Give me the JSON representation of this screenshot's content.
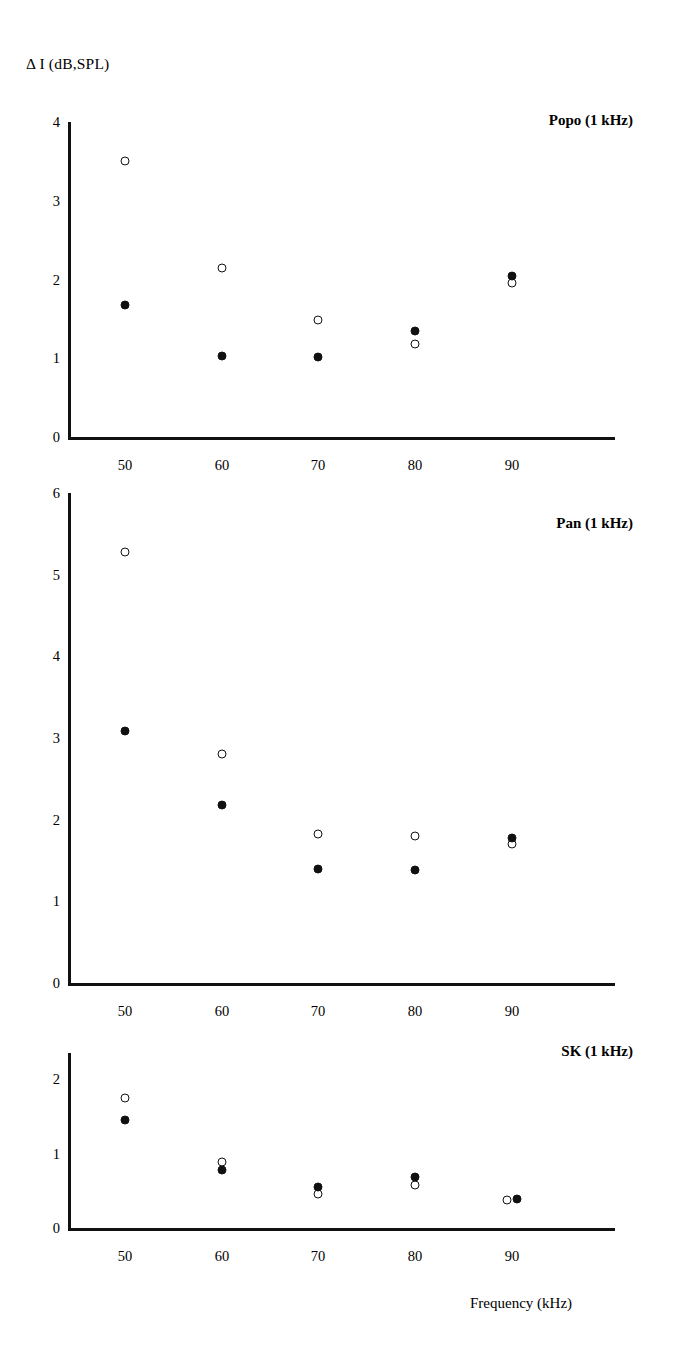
{
  "figure": {
    "ylabel": "Δ I (dB,SPL)",
    "xlabel": "Frequency (kHz)"
  },
  "chart_data": [
    {
      "type": "scatter",
      "title": "Popo (1 kHz)",
      "xlabel": "",
      "ylabel": "Δ I (dB,SPL)",
      "x": [
        50,
        60,
        70,
        80,
        90
      ],
      "xticklabels": [
        "50",
        "60",
        "70",
        "80",
        "90"
      ],
      "yticklabels": [
        "0",
        "1",
        "2",
        "3",
        "4"
      ],
      "xlim": [
        44,
        96
      ],
      "ylim": [
        0,
        4
      ],
      "grid": false,
      "legend": null,
      "series": [
        {
          "name": "open-circle",
          "marker": "open",
          "values": [
            3.5,
            2.15,
            1.48,
            1.18,
            1.95
          ]
        },
        {
          "name": "filled-circle",
          "marker": "filled",
          "values": [
            1.67,
            1.03,
            1.02,
            1.35,
            2.05
          ]
        }
      ]
    },
    {
      "type": "scatter",
      "title": "Pan (1 kHz)",
      "xlabel": "",
      "ylabel": "Δ I (dB,SPL)",
      "x": [
        50,
        60,
        70,
        80,
        90
      ],
      "xticklabels": [
        "50",
        "60",
        "70",
        "80",
        "90"
      ],
      "yticklabels": [
        "0",
        "1",
        "2",
        "3",
        "4",
        "5",
        "6"
      ],
      "xlim": [
        44,
        96
      ],
      "ylim": [
        0,
        6
      ],
      "grid": false,
      "legend": null,
      "series": [
        {
          "name": "open-circle",
          "marker": "open",
          "values": [
            5.28,
            2.8,
            1.82,
            1.8,
            1.7
          ]
        },
        {
          "name": "filled-circle",
          "marker": "filled",
          "values": [
            3.08,
            2.18,
            1.4,
            1.38,
            1.78
          ]
        }
      ]
    },
    {
      "type": "scatter",
      "title": "SK (1 kHz)",
      "xlabel": "Frequency (kHz)",
      "ylabel": "Δ I (dB,SPL)",
      "x": [
        50,
        60,
        70,
        80,
        90
      ],
      "xticklabels": [
        "50",
        "60",
        "70",
        "80",
        "90"
      ],
      "yticklabels": [
        "0",
        "1",
        "2"
      ],
      "xlim": [
        44,
        96
      ],
      "ylim": [
        0,
        2.35
      ],
      "grid": false,
      "legend": null,
      "series": [
        {
          "name": "open-circle",
          "marker": "open",
          "values": [
            1.75,
            0.88,
            0.45,
            0.58,
            0.38
          ]
        },
        {
          "name": "filled-circle",
          "marker": "filled",
          "values": [
            1.45,
            0.78,
            0.55,
            0.68,
            0.39
          ]
        }
      ]
    }
  ],
  "colors": {
    "axis": "#111111",
    "marker": "#111111",
    "background": "#ffffff"
  }
}
